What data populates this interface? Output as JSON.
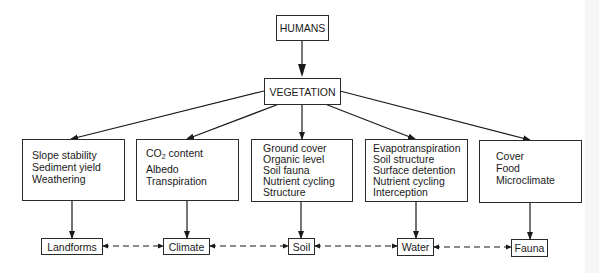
{
  "diagram": {
    "top_node": {
      "label": "HUMANS"
    },
    "middle_node": {
      "label": "VEGETATION"
    },
    "attribute_boxes": [
      {
        "id": "landforms_attrs",
        "lines": [
          "Slope stability",
          "Sediment yield",
          "Weathering"
        ]
      },
      {
        "id": "climate_attrs",
        "lines": [
          "CO",
          "Albedo",
          "Transpiration"
        ],
        "co2": {
          "prefix": "CO",
          "subscript": "2",
          "suffix": " content"
        }
      },
      {
        "id": "soil_attrs",
        "lines": [
          "Ground cover",
          "Organic level",
          "Soil fauna",
          "Nutrient cycling",
          "Structure"
        ]
      },
      {
        "id": "water_attrs",
        "lines": [
          "Evapotranspiration",
          "Soil structure",
          "Surface detention",
          "Nutrient cycling",
          "Interception"
        ]
      },
      {
        "id": "fauna_attrs",
        "lines": [
          "Cover",
          "Food",
          "Microclimate"
        ]
      }
    ],
    "bottom_nodes": [
      {
        "label": "Landforms"
      },
      {
        "label": "Climate"
      },
      {
        "label": "Soil"
      },
      {
        "label": "Water"
      },
      {
        "label": "Fauna"
      }
    ],
    "connections": {
      "humans_to_vegetation": "solid-arrow",
      "vegetation_to_attribute_boxes": "solid-arrow",
      "attribute_boxes_to_bottom_nodes": "solid-arrow",
      "between_bottom_nodes": "dashed-double-arrow"
    },
    "colors": {
      "line": "#1a1a1a",
      "background": "#ffffff"
    }
  }
}
